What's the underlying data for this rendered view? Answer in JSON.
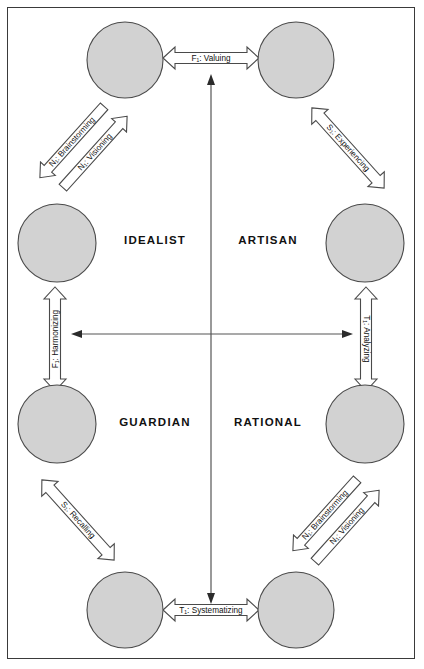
{
  "diagram": {
    "frame": {
      "border_color": "#3a3a3a",
      "background": "#ffffff"
    },
    "style": {
      "circle_fill": "#d2d2d2",
      "circle_stroke": "#4a4a4a",
      "arrow_fill": "#ffffff",
      "arrow_stroke": "#4a4a4a",
      "axis_color": "#555555",
      "text_color": "#111111"
    },
    "quadrants": [
      {
        "id": "idealist",
        "label": "IDEALIST",
        "x": 155,
        "y": 240
      },
      {
        "id": "artisan",
        "label": "ARTISAN",
        "x": 268,
        "y": 240
      },
      {
        "id": "guardian",
        "label": "GUARDIAN",
        "x": 155,
        "y": 422
      },
      {
        "id": "rational",
        "label": "RATIONAL",
        "x": 268,
        "y": 422
      }
    ],
    "nodes": [
      {
        "id": "top-left",
        "cx": 125,
        "cy": 60,
        "r": 38
      },
      {
        "id": "top-right",
        "cx": 296,
        "cy": 60,
        "r": 38
      },
      {
        "id": "mid-left",
        "cx": 57,
        "cy": 243,
        "r": 39
      },
      {
        "id": "mid-right",
        "cx": 365,
        "cy": 243,
        "r": 39
      },
      {
        "id": "low-left",
        "cx": 57,
        "cy": 424,
        "r": 39
      },
      {
        "id": "low-right",
        "cx": 365,
        "cy": 424,
        "r": 39
      },
      {
        "id": "bottom-left",
        "cx": 125,
        "cy": 610,
        "r": 38
      },
      {
        "id": "bottom-right",
        "cx": 296,
        "cy": 610,
        "r": 38
      }
    ],
    "edges": [
      {
        "id": "valuing",
        "function": "F",
        "subscript": "i",
        "name": "Valuing",
        "label": "F₁: Valuing",
        "from": "top-left",
        "to": "top-right",
        "orientation": "horizontal",
        "label_x": 211,
        "label_y": 58,
        "rotation": 0
      },
      {
        "id": "brainstorming-upper-left",
        "function": "N",
        "subscript": "e",
        "name": "Brainstorming",
        "label": "N₁: Brainstorming",
        "from": "mid-left",
        "to": "top-left",
        "orientation": "diagonal",
        "label_x": 76,
        "label_y": 140,
        "rotation": -48
      },
      {
        "id": "visioning-upper-left",
        "function": "N",
        "subscript": "i",
        "name": "Visioning",
        "label": "N₁: Visioning",
        "from": "top-left",
        "to": "mid-left",
        "orientation": "diagonal",
        "label_x": 93,
        "label_y": 152,
        "rotation": -48
      },
      {
        "id": "experiencing",
        "function": "S",
        "subscript": "e",
        "name": "Experiencing",
        "label": "S₁: Experiencing",
        "from": "top-right",
        "to": "mid-right",
        "orientation": "diagonal",
        "label_x": 348,
        "label_y": 148,
        "rotation": 48
      },
      {
        "id": "harmonizing",
        "function": "F",
        "subscript": "e",
        "name": "Harmonizing",
        "label": "F₁: Harmonizing",
        "from": "low-left",
        "to": "mid-left",
        "orientation": "vertical",
        "label_x": 55,
        "label_y": 339,
        "rotation": -90
      },
      {
        "id": "analyzing",
        "function": "T",
        "subscript": "i",
        "name": "Analyzing",
        "label": "T₁: Analyzing",
        "from": "low-right",
        "to": "mid-right",
        "orientation": "vertical",
        "label_x": 366,
        "label_y": 339,
        "rotation": 90
      },
      {
        "id": "recalling",
        "function": "S",
        "subscript": "i",
        "name": "Recalling",
        "label": "S₁: Recalling",
        "from": "low-left",
        "to": "bottom-left",
        "orientation": "diagonal",
        "label_x": 78,
        "label_y": 520,
        "rotation": 48
      },
      {
        "id": "brainstorming-lower-right",
        "function": "N",
        "subscript": "e",
        "name": "Brainstorming",
        "label": "N₁: Brainstorming",
        "from": "bottom-right",
        "to": "low-right",
        "orientation": "diagonal",
        "label_x": 328,
        "label_y": 513,
        "rotation": -48
      },
      {
        "id": "visioning-lower-right",
        "function": "N",
        "subscript": "i",
        "name": "Visioning",
        "label": "N₁: Visioning",
        "from": "low-right",
        "to": "bottom-right",
        "orientation": "diagonal",
        "label_x": 345,
        "label_y": 527,
        "rotation": -48
      },
      {
        "id": "systematizing",
        "function": "T",
        "subscript": "e",
        "name": "Systematizing",
        "label": "T₁: Systematizing",
        "from": "bottom-left",
        "to": "bottom-right",
        "orientation": "horizontal",
        "label_x": 211,
        "label_y": 610,
        "rotation": 0
      }
    ],
    "axes": {
      "vertical": {
        "x": 211,
        "y_top": 77,
        "y_bottom": 600
      },
      "horizontal": {
        "y": 334,
        "x_left": 73,
        "x_right": 350
      }
    }
  }
}
